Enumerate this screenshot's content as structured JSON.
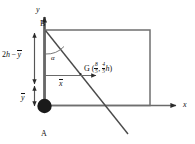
{
  "figure": {
    "background_color": "#ffffff",
    "stroke_color": "#3a3a3a",
    "text_color": "#111111",
    "axes": {
      "y_label": "y",
      "x_label": "x"
    },
    "points": {
      "A": {
        "label": "A",
        "marker": "filled-circle",
        "marker_color": "#1a1a1a"
      },
      "B": {
        "label": "B"
      },
      "G": {
        "label": "G",
        "coord_open": "(",
        "coord_x_num": "8",
        "coord_x_den": "5",
        "coord_separator": ",",
        "coord_y_num": "4",
        "coord_y_den": "5",
        "coord_y_unit": "h",
        "coord_close": ")"
      }
    },
    "angle": {
      "label": "α"
    },
    "dimensions": {
      "upper_vertical": {
        "prefix": "2",
        "prefix_var": "h",
        "minus": "−",
        "var": "y"
      },
      "lower_vertical": {
        "var": "y"
      },
      "horizontal": {
        "var": "x"
      }
    }
  }
}
